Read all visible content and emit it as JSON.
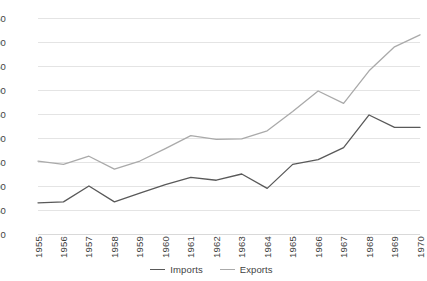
{
  "chart_data": {
    "type": "line",
    "title": "",
    "xlabel": "",
    "ylabel": "",
    "categories": [
      "1955",
      "1956",
      "1957",
      "1958",
      "1959",
      "1960",
      "1961",
      "1962",
      "1963",
      "1964",
      "1965",
      "1966",
      "1967",
      "1968",
      "1969",
      "1970"
    ],
    "series": [
      {
        "name": "Imports",
        "color": "#595959",
        "values": [
          65,
          67,
          100,
          67,
          85,
          103,
          118,
          112,
          125,
          95,
          145,
          155,
          180,
          248,
          222,
          222
        ]
      },
      {
        "name": "Exports",
        "color": "#aaaaaa",
        "values": [
          152,
          145,
          162,
          135,
          152,
          178,
          205,
          197,
          198,
          215,
          255,
          298,
          272,
          340,
          390,
          415
        ]
      }
    ],
    "ylim": [
      0,
      450
    ],
    "ytick_values": [
      0,
      50,
      100,
      150,
      200,
      250,
      300,
      350,
      400,
      450
    ],
    "ytick_labels": [
      "0",
      "50",
      "100",
      "150",
      "200",
      "250",
      "300",
      "350",
      "400",
      "450"
    ],
    "grid": true,
    "legend_position": "bottom"
  },
  "legend": {
    "entries": [
      {
        "label": "Imports"
      },
      {
        "label": "Exports"
      }
    ]
  }
}
